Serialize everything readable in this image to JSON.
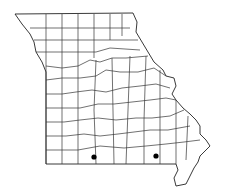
{
  "map": {
    "region": "Missouri",
    "subdivision": "counties",
    "background_color": "#ffffff",
    "line_color": "#333333",
    "marker_color": "#000000",
    "markers": [
      {
        "id": "marker-1",
        "x": 94,
        "y": 157,
        "label": ""
      },
      {
        "id": "marker-2",
        "x": 156,
        "y": 156,
        "label": ""
      }
    ]
  }
}
